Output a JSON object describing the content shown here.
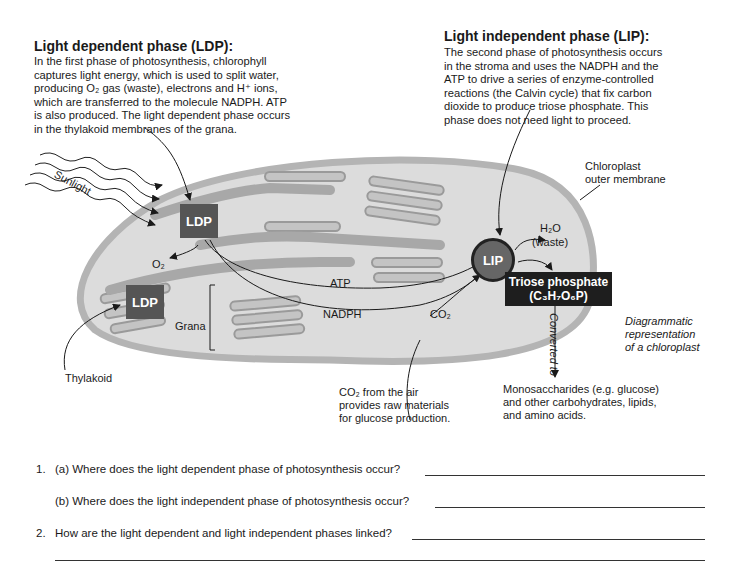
{
  "ldp_section": {
    "heading": "Light dependent phase (LDP):",
    "lines": [
      "In the first phase of photosynthesis, chlorophyll",
      "captures light energy, which is used to split water,",
      "producing O₂ gas (waste), electrons and H⁺ ions,",
      "which are transferred to the molecule NADPH. ATP",
      "is also produced. The light dependent phase occurs",
      "in the thylakoid membranes of the grana."
    ]
  },
  "lip_section": {
    "heading": "Light independent phase (LIP):",
    "lines": [
      "The second phase of photosynthesis occurs",
      "in the stroma and uses the NADPH and the",
      "ATP to drive a series of enzyme-controlled",
      "reactions (the Calvin cycle) that fix carbon",
      "dioxide to produce triose phosphate. This",
      "phase does not need light to proceed."
    ],
    "bold_term": "Calvin cycle"
  },
  "diagram": {
    "sunlight": "Sunlight",
    "ldp_label": "LDP",
    "lip_label": "LIP",
    "o2": "O₂",
    "atp": "ATP",
    "nadph": "NADPH",
    "co2": "CO₂",
    "h2o": "H₂O",
    "waste": "(waste)",
    "grana": "Grana",
    "thylakoid": "Thylakoid",
    "outer_membrane": [
      "Chloroplast",
      "outer membrane"
    ],
    "triose_title": "Triose phosphate",
    "triose_formula": "(C₃H₇O₆P)",
    "converted_to": "Converted to",
    "caption": [
      "Diagrammatic",
      "representation",
      "of a chloroplast"
    ],
    "co2_note": [
      "CO₂ from the air",
      "provides raw materials",
      "for glucose production."
    ],
    "products": [
      "Monosaccharides (e.g. glucose)",
      "and other carbohydrates, lipids,",
      "and amino acids."
    ],
    "colors": {
      "stroma": "#dcdcdc",
      "membrane": "#b4b4b4",
      "thylakoid": "#a8a8a8",
      "ldp_box": "#555555",
      "triose_box": "#1e1e1e"
    }
  },
  "questions": [
    {
      "number": "1.",
      "text": "(a) Where does the light dependent phase of photosynthesis occur?"
    },
    {
      "number": "",
      "text": "(b) Where does the light independent phase of photosynthesis occur?"
    },
    {
      "number": "2.",
      "text": "How are the light dependent and light independent phases linked?"
    }
  ]
}
